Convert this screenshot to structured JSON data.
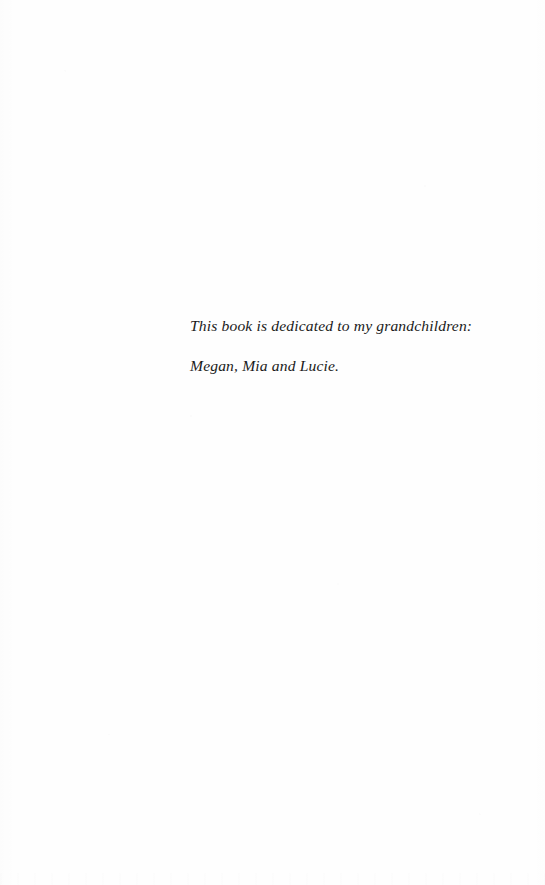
{
  "page": {
    "kind": "book-dedication-page",
    "width": 545,
    "height": 885,
    "background_color": "#fefefe",
    "text_color": "#1a1a1a"
  },
  "dedication": {
    "lines": [
      "This book is dedicated to my grandchildren:",
      "Megan, Mia and Lucie."
    ],
    "full_text": "This book is dedicated to my grandchildren: Megan, Mia and Lucie.",
    "style": "italic-serif",
    "alignment": "left"
  }
}
